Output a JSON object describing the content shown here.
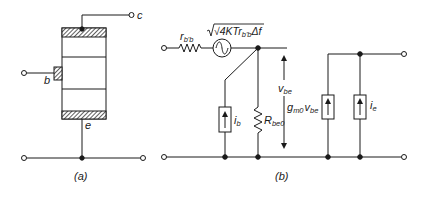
{
  "figure": {
    "colors": {
      "ink": "#1a1a1a",
      "background": "#ffffff"
    },
    "panel_a": {
      "caption": "(a)",
      "terminals": {
        "collector": "c",
        "base": "b",
        "emitter": "e"
      },
      "structure": "transistor-cross-section-with-hatched-contacts"
    },
    "panel_b": {
      "caption": "(b)",
      "series_resistor": {
        "symbol": "r",
        "subscript": "b'b"
      },
      "noise_source": {
        "prefix": "√4KTr",
        "subscript": "b'b",
        "suffix": "Δf"
      },
      "base_current_source": {
        "symbol": "i",
        "subscript": "b"
      },
      "input_resistor": {
        "symbol": "R",
        "subscript": "be0"
      },
      "voltage": {
        "symbol": "v",
        "subscript": "be"
      },
      "transconductance_source": {
        "g": "g",
        "g_sub": "m0",
        "v": "v",
        "v_sub": "be"
      },
      "output_current_source": {
        "symbol": "i",
        "subscript": "e"
      }
    }
  }
}
